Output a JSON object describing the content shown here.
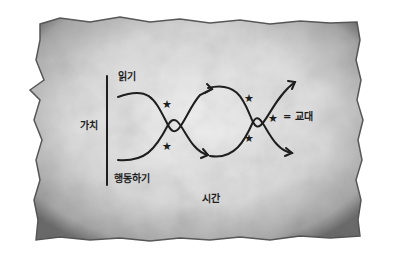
{
  "diagram": {
    "y_axis_label": "가치",
    "top_label": "읽기",
    "bottom_label": "행동하기",
    "x_axis_label": "시간",
    "legend": {
      "symbol": "★",
      "equals": "=",
      "text": "교대"
    },
    "crossings": 2,
    "star_markers": 4,
    "curves": [
      {
        "name": "reading-curve",
        "start": "top",
        "pattern": "wave crossing down-up"
      },
      {
        "name": "doing-curve",
        "start": "bottom",
        "pattern": "wave crossing up-down"
      }
    ]
  },
  "colors": {
    "ink": "#1e1e1e",
    "paper_light": "#e9e9e9",
    "paper_dark": "#8a8a8a",
    "background": "#ffffff"
  }
}
